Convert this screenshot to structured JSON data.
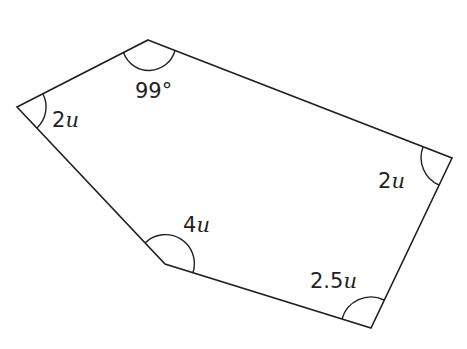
{
  "diagram": {
    "type": "polygon",
    "shape": "pentagon",
    "stroke_color": "#231f20",
    "background": "#ffffff",
    "vertices": [
      {
        "id": "top",
        "x": 148,
        "y": 40
      },
      {
        "id": "right",
        "x": 452,
        "y": 158
      },
      {
        "id": "bottom-right",
        "x": 371,
        "y": 328
      },
      {
        "id": "bottom-left",
        "x": 165,
        "y": 264
      },
      {
        "id": "left",
        "x": 17,
        "y": 107
      }
    ],
    "angles": [
      {
        "vertex": "top",
        "number": "99",
        "unit": "°",
        "label": "99°"
      },
      {
        "vertex": "left",
        "number": "2",
        "unit": "u",
        "label": "2u"
      },
      {
        "vertex": "bottom-left",
        "number": "4",
        "unit": "u",
        "label": "4u"
      },
      {
        "vertex": "right",
        "number": "2",
        "unit": "u",
        "label": "2u"
      },
      {
        "vertex": "bottom-right",
        "number": "2.5",
        "unit": "u",
        "label": "2.5u"
      }
    ]
  }
}
